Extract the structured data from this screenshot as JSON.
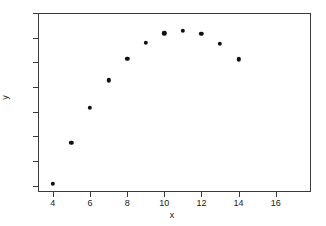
{
  "chart_data": {
    "type": "scatter",
    "title": "",
    "xlabel": "x",
    "ylabel": "y",
    "xlim": [
      3.2,
      17.9
    ],
    "ylim": [
      2.75,
      10.0
    ],
    "xticks": [
      4,
      6,
      8,
      10,
      12,
      14,
      16
    ],
    "yticks": [
      3,
      4,
      5,
      6,
      7,
      8,
      9,
      10
    ],
    "grid": false,
    "legend": null,
    "marker": "filled-circle",
    "marker_color": "#101010",
    "x": [
      4,
      5,
      6,
      7,
      8,
      9,
      10,
      11,
      12,
      13,
      14
    ],
    "y": [
      3.08,
      4.75,
      6.15,
      7.28,
      8.15,
      8.8,
      9.17,
      9.28,
      9.15,
      8.75,
      8.12
    ],
    "points": [
      {
        "x": 4,
        "y": 3.08
      },
      {
        "x": 5,
        "y": 4.75
      },
      {
        "x": 6,
        "y": 6.15
      },
      {
        "x": 7,
        "y": 7.28
      },
      {
        "x": 8,
        "y": 8.15
      },
      {
        "x": 9,
        "y": 8.8
      },
      {
        "x": 10,
        "y": 9.17
      },
      {
        "x": 11,
        "y": 9.28
      },
      {
        "x": 12,
        "y": 9.15
      },
      {
        "x": 13,
        "y": 8.75
      },
      {
        "x": 14,
        "y": 8.12
      }
    ]
  },
  "axes": {
    "x_label": "x",
    "y_label": "y",
    "x_tick_labels": [
      "4",
      "6",
      "8",
      "10",
      "12",
      "14",
      "16"
    ],
    "y_tick_labels": [
      "3",
      "4",
      "5",
      "6",
      "7",
      "8",
      "9",
      "10"
    ],
    "frame_color": "#3a3a3a",
    "background": "#ffffff"
  }
}
